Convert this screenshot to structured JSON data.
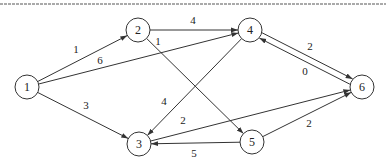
{
  "diagram": {
    "type": "directed-weighted-graph",
    "nodes": [
      {
        "id": "1",
        "label": "1",
        "x": 27,
        "y": 87
      },
      {
        "id": "2",
        "label": "2",
        "x": 138,
        "y": 30
      },
      {
        "id": "3",
        "label": "3",
        "x": 139,
        "y": 144
      },
      {
        "id": "4",
        "label": "4",
        "x": 250,
        "y": 30
      },
      {
        "id": "5",
        "label": "5",
        "x": 252,
        "y": 142
      },
      {
        "id": "6",
        "label": "6",
        "x": 362,
        "y": 87
      }
    ],
    "edges": [
      {
        "from": "1",
        "to": "2",
        "weight": "1",
        "lx": 76,
        "ly": 53
      },
      {
        "from": "1",
        "to": "4",
        "weight": "6",
        "lx": 100,
        "ly": 64
      },
      {
        "from": "1",
        "to": "3",
        "weight": "3",
        "lx": 86,
        "ly": 109
      },
      {
        "from": "2",
        "to": "4",
        "weight": "4",
        "lx": 193,
        "ly": 24
      },
      {
        "from": "2",
        "to": "5",
        "weight": "1",
        "lx": 158,
        "ly": 45
      },
      {
        "from": "4",
        "to": "3",
        "weight": "4",
        "lx": 164,
        "ly": 105
      },
      {
        "from": "4",
        "to": "6",
        "weight": "2",
        "lx": 310,
        "ly": 50,
        "offset": -3
      },
      {
        "from": "6",
        "to": "4",
        "weight": "0",
        "lx": 305,
        "ly": 75,
        "offset": -3
      },
      {
        "from": "3",
        "to": "6",
        "weight": "2",
        "lx": 183,
        "ly": 124
      },
      {
        "from": "5",
        "to": "3",
        "weight": "5",
        "lx": 194,
        "ly": 157
      },
      {
        "from": "5",
        "to": "6",
        "weight": "2",
        "lx": 309,
        "ly": 127
      }
    ],
    "node_radius": 12,
    "stroke_color": "#333333"
  }
}
